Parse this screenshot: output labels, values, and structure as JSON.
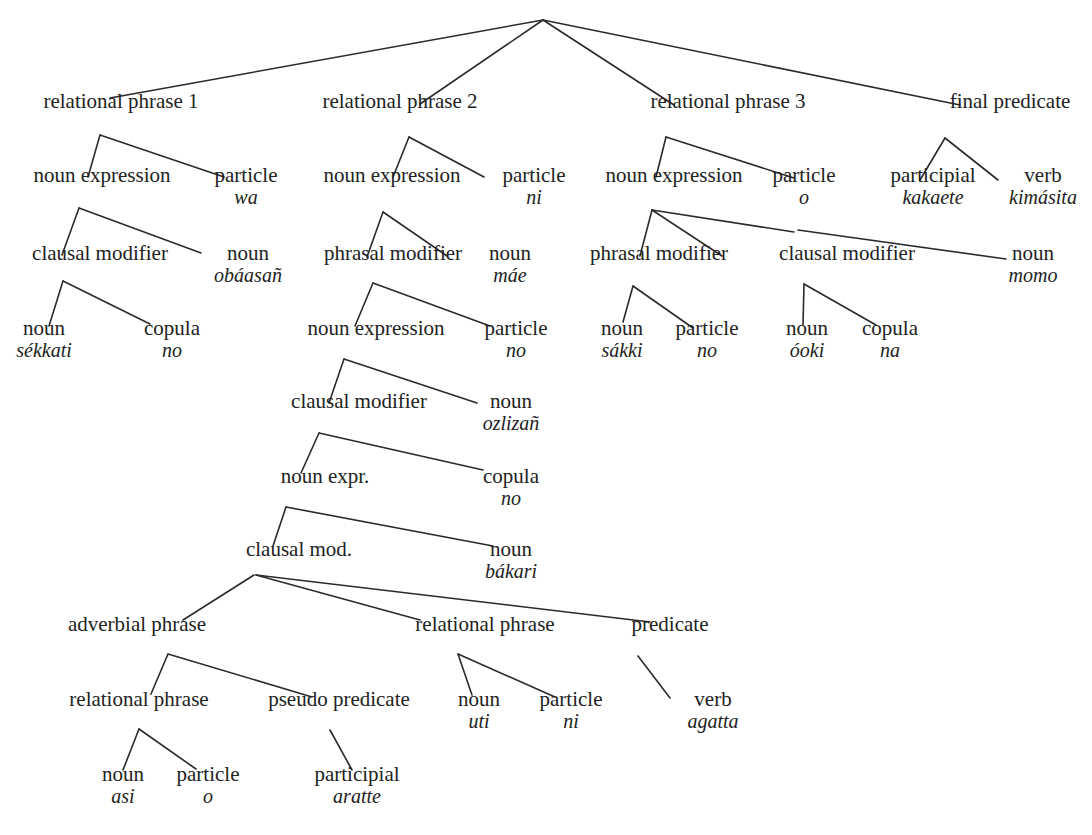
{
  "diagram": {
    "type": "syntax-tree",
    "nodes": [
      {
        "id": "rp1",
        "cat": "relational phrase 1",
        "word": "",
        "x": 121,
        "y": 103
      },
      {
        "id": "rp2",
        "cat": "relational phrase 2",
        "word": "",
        "x": 400,
        "y": 103
      },
      {
        "id": "rp3",
        "cat": "relational phrase 3",
        "word": "",
        "x": 728,
        "y": 103
      },
      {
        "id": "fp",
        "cat": "final predicate",
        "word": "",
        "x": 1010,
        "y": 103
      },
      {
        "id": "ne1",
        "cat": "noun expression",
        "word": "",
        "x": 102,
        "y": 177
      },
      {
        "id": "pa1",
        "cat": "particle",
        "word": "wa",
        "x": 246,
        "y": 177
      },
      {
        "id": "ne2",
        "cat": "noun expression",
        "word": "",
        "x": 392,
        "y": 177
      },
      {
        "id": "pa2",
        "cat": "particle",
        "word": "ni",
        "x": 534,
        "y": 177
      },
      {
        "id": "ne3",
        "cat": "noun expression",
        "word": "",
        "x": 674,
        "y": 177
      },
      {
        "id": "pa3",
        "cat": "particle",
        "word": "o",
        "x": 804,
        "y": 177
      },
      {
        "id": "ptc1",
        "cat": "participial",
        "word": "kakaete",
        "x": 933,
        "y": 177
      },
      {
        "id": "vb1",
        "cat": "verb",
        "word": "kimásita",
        "x": 1043,
        "y": 177
      },
      {
        "id": "cm1",
        "cat": "clausal modifier",
        "word": "",
        "x": 100,
        "y": 255
      },
      {
        "id": "n1",
        "cat": "noun",
        "word": "obáasañ",
        "x": 248,
        "y": 255
      },
      {
        "id": "pm2",
        "cat": "phrasal modifier",
        "word": "",
        "x": 393,
        "y": 255
      },
      {
        "id": "n2",
        "cat": "noun",
        "word": "máe",
        "x": 510,
        "y": 255
      },
      {
        "id": "pm3",
        "cat": "phrasal modifier",
        "word": "",
        "x": 659,
        "y": 255
      },
      {
        "id": "cm3",
        "cat": "clausal modifier",
        "word": "",
        "x": 847,
        "y": 255
      },
      {
        "id": "n3",
        "cat": "noun",
        "word": "momo",
        "x": 1033,
        "y": 255
      },
      {
        "id": "n4",
        "cat": "noun",
        "word": "sékkati",
        "x": 44,
        "y": 330
      },
      {
        "id": "cop1",
        "cat": "copula",
        "word": "no",
        "x": 172,
        "y": 330
      },
      {
        "id": "ne4",
        "cat": "noun expression",
        "word": "",
        "x": 376,
        "y": 330
      },
      {
        "id": "pa4",
        "cat": "particle",
        "word": "no",
        "x": 516,
        "y": 330
      },
      {
        "id": "n5",
        "cat": "noun",
        "word": "sákki",
        "x": 622,
        "y": 330
      },
      {
        "id": "pa5",
        "cat": "particle",
        "word": "no",
        "x": 707,
        "y": 330
      },
      {
        "id": "n6",
        "cat": "noun",
        "word": "óoki",
        "x": 807,
        "y": 330
      },
      {
        "id": "cop2",
        "cat": "copula",
        "word": "na",
        "x": 890,
        "y": 330
      },
      {
        "id": "cm4",
        "cat": "clausal modifier",
        "word": "",
        "x": 359,
        "y": 403
      },
      {
        "id": "n7",
        "cat": "noun",
        "word": "ozlizañ",
        "x": 511,
        "y": 403
      },
      {
        "id": "nex",
        "cat": "noun expr.",
        "word": "",
        "x": 325,
        "y": 478
      },
      {
        "id": "cop3",
        "cat": "copula",
        "word": "no",
        "x": 511,
        "y": 478
      },
      {
        "id": "cmd",
        "cat": "clausal mod.",
        "word": "",
        "x": 299,
        "y": 551
      },
      {
        "id": "n8",
        "cat": "noun",
        "word": "bákari",
        "x": 511,
        "y": 551
      },
      {
        "id": "adv",
        "cat": "adverbial phrase",
        "word": "",
        "x": 137,
        "y": 626
      },
      {
        "id": "rpx",
        "cat": "relational phrase",
        "word": "",
        "x": 485,
        "y": 626
      },
      {
        "id": "pred",
        "cat": "predicate",
        "word": "",
        "x": 670,
        "y": 626
      },
      {
        "id": "rpy",
        "cat": "relational phrase",
        "word": "",
        "x": 139,
        "y": 701
      },
      {
        "id": "psp",
        "cat": "pseudo predicate",
        "word": "",
        "x": 339,
        "y": 701
      },
      {
        "id": "n9",
        "cat": "noun",
        "word": "uti",
        "x": 479,
        "y": 701
      },
      {
        "id": "pa6",
        "cat": "particle",
        "word": "ni",
        "x": 571,
        "y": 701
      },
      {
        "id": "vb2",
        "cat": "verb",
        "word": "agatta",
        "x": 713,
        "y": 701
      },
      {
        "id": "n10",
        "cat": "noun",
        "word": "asi",
        "x": 123,
        "y": 776
      },
      {
        "id": "pa7",
        "cat": "particle",
        "word": "o",
        "x": 208,
        "y": 776
      },
      {
        "id": "ptc2",
        "cat": "participial",
        "word": "aratte",
        "x": 357,
        "y": 776
      }
    ],
    "edges": [
      [
        543,
        20,
        110,
        98
      ],
      [
        543,
        20,
        420,
        104
      ],
      [
        543,
        20,
        674,
        105
      ],
      [
        543,
        20,
        960,
        105
      ],
      [
        100,
        135,
        88,
        177
      ],
      [
        100,
        135,
        224,
        177
      ],
      [
        409,
        137,
        393,
        177
      ],
      [
        409,
        137,
        484,
        177
      ],
      [
        666,
        137,
        656,
        177
      ],
      [
        666,
        137,
        794,
        178
      ],
      [
        945,
        138,
        920,
        180
      ],
      [
        945,
        138,
        998,
        180
      ],
      [
        79,
        208,
        62,
        255
      ],
      [
        79,
        208,
        201,
        253
      ],
      [
        383,
        212,
        367,
        257
      ],
      [
        383,
        212,
        447,
        256
      ],
      [
        652,
        210,
        640,
        256
      ],
      [
        652,
        210,
        794,
        232
      ],
      [
        652,
        210,
        722,
        256
      ],
      [
        798,
        230,
        1006,
        259
      ],
      [
        373,
        283,
        355,
        326
      ],
      [
        373,
        283,
        490,
        326
      ],
      [
        63,
        281,
        49,
        326
      ],
      [
        63,
        281,
        150,
        324
      ],
      [
        633,
        286,
        623,
        322
      ],
      [
        633,
        286,
        693,
        328
      ],
      [
        804,
        284,
        803,
        325
      ],
      [
        804,
        284,
        876,
        325
      ],
      [
        344,
        359,
        329,
        403
      ],
      [
        344,
        359,
        477,
        403
      ],
      [
        319,
        433,
        301,
        473
      ],
      [
        319,
        433,
        483,
        470
      ],
      [
        286,
        507,
        273,
        546
      ],
      [
        286,
        507,
        493,
        546
      ],
      [
        254,
        575,
        183,
        620
      ],
      [
        256,
        575,
        420,
        620
      ],
      [
        256,
        575,
        650,
        622
      ],
      [
        168,
        654,
        151,
        694
      ],
      [
        168,
        654,
        312,
        697
      ],
      [
        458,
        654,
        472,
        695
      ],
      [
        458,
        654,
        555,
        697
      ],
      [
        638,
        656,
        670,
        698
      ],
      [
        139,
        729,
        123,
        770
      ],
      [
        139,
        729,
        196,
        769
      ],
      [
        330,
        730,
        352,
        770
      ]
    ]
  }
}
